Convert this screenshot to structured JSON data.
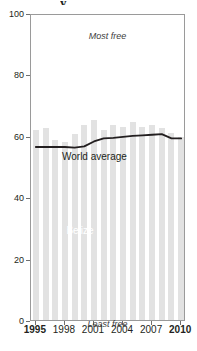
{
  "chart_data": {
    "type": "bar",
    "title": "",
    "xlabel": "",
    "ylabel": "",
    "ylim": [
      0,
      100
    ],
    "xlim": [
      1994.5,
      2010.5
    ],
    "grid": false,
    "legend": "inline-labels",
    "categories": [
      1995,
      1996,
      1997,
      1998,
      1999,
      2000,
      2001,
      2002,
      2003,
      2004,
      2005,
      2006,
      2007,
      2008,
      2009,
      2010
    ],
    "series": [
      {
        "name": "Belize",
        "type": "bar",
        "color": "#e2e2e2",
        "values": [
          62.0,
          62.5,
          58.5,
          58.0,
          60.5,
          63.5,
          65.0,
          62.0,
          63.5,
          63.0,
          64.5,
          63.0,
          63.5,
          62.5,
          61.0,
          59.5
        ]
      },
      {
        "name": "World average",
        "type": "line",
        "color": "#231f20",
        "values": [
          57.0,
          57.0,
          57.0,
          57.0,
          56.8,
          57.2,
          58.8,
          59.8,
          60.0,
          60.3,
          60.6,
          60.8,
          61.0,
          61.2,
          59.8,
          59.8
        ]
      }
    ],
    "yticks": [
      0,
      20,
      40,
      60,
      80,
      100
    ],
    "xticks": [
      1995,
      1998,
      2001,
      2004,
      2007,
      2010
    ],
    "xticks_bold": [
      1995,
      2010
    ],
    "annotations": [
      {
        "name": "most-free",
        "text": "Most free",
        "position": "top-center"
      },
      {
        "name": "least-free",
        "text": "Least free",
        "position": "bottom-center"
      },
      {
        "name": "world-average-label",
        "text": "World average",
        "position": "inline"
      },
      {
        "name": "series-label",
        "text": "Belize",
        "position": "inside-bars"
      }
    ]
  },
  "axes": {
    "y_labels": [
      "100",
      "80",
      "60",
      "40",
      "20",
      "0"
    ],
    "x_labels": [
      "1995",
      "1998",
      "2001",
      "2004",
      "2007",
      "2010"
    ]
  },
  "labels": {
    "most_free": "Most free",
    "least_free": "Least free",
    "world_average": "World average",
    "series_name": "Belize"
  },
  "title_fragment": "y",
  "colors": {
    "bar": "#e2e2e2",
    "line": "#231f20",
    "frame": "#9a9a9a",
    "text": "#231f20",
    "series_label": "#ffffff",
    "background": "#ffffff"
  }
}
